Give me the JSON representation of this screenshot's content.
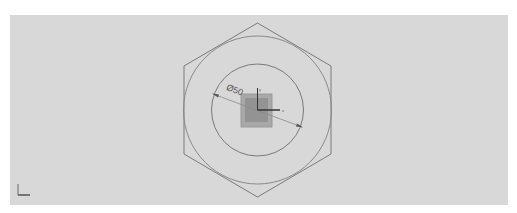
{
  "viewport": {
    "background": "#d8d8d8",
    "page_background": "#ffffff"
  },
  "sketch": {
    "hexagon": {
      "center": [
        257.5,
        110
      ],
      "stroke": "#7a7a7a"
    },
    "outer_circle": {
      "radius": 74,
      "stroke": "#8a8a8a"
    },
    "inner_circle": {
      "radius": 46,
      "stroke": "#7a7a7a"
    },
    "square_outer": {
      "fill": "#a8a8a8"
    },
    "square_inner": {
      "fill": "#939393"
    },
    "dimension": {
      "label": "Ø50",
      "start": [
        215,
        95
      ],
      "end": [
        301,
        126
      ]
    },
    "origin_axes": {
      "x_label": "x",
      "y_label": "y"
    }
  },
  "triad": {
    "label": "view-triad"
  }
}
